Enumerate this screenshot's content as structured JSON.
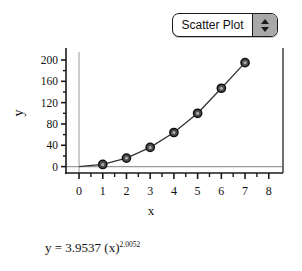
{
  "control": {
    "name": "plot-type-stepper",
    "selected_value": "Scatter Plot",
    "up_arrow": "triangle-up-icon",
    "down_arrow": "triangle-down-icon",
    "options": [
      "Scatter Plot"
    ]
  },
  "equation": {
    "base": "y = 3.9537 (x)",
    "exponent": "2.0052",
    "full": "y = 3.9537 (x)^2.0052"
  },
  "colors": {
    "axis": "#1a1a1a",
    "reference_line": "#9a9a9a",
    "marker_fill": "#4d4d4d",
    "marker_stroke": "#111111",
    "curve": "#333333",
    "stepper_bg": "#a8a8a8",
    "background": "#ffffff"
  },
  "chart_data": {
    "type": "scatter",
    "title": "",
    "xlabel": "x",
    "ylabel": "y",
    "xlim": [
      -0.55,
      8.6
    ],
    "ylim": [
      -12,
      215
    ],
    "xticks": [
      0,
      1,
      2,
      3,
      4,
      5,
      6,
      7,
      8
    ],
    "xtick_labels": [
      "0",
      "1",
      "2",
      "3",
      "4",
      "5",
      "6",
      "7",
      "8"
    ],
    "yticks": [
      0,
      40,
      80,
      120,
      160,
      200
    ],
    "ytick_labels": [
      "0",
      "40",
      "80",
      "120",
      "160",
      "200"
    ],
    "minor_ticks": true,
    "grid": false,
    "legend": false,
    "reference_lines": {
      "x": 0,
      "y": 0
    },
    "series": [
      {
        "name": "data",
        "marker": "circle",
        "connected": true,
        "x": [
          1,
          2,
          3,
          4,
          5,
          6,
          7
        ],
        "y": [
          4,
          16,
          36,
          64,
          100,
          147,
          195
        ]
      }
    ],
    "fit_equation": "y = 3.9537 (x)^2.0052"
  }
}
